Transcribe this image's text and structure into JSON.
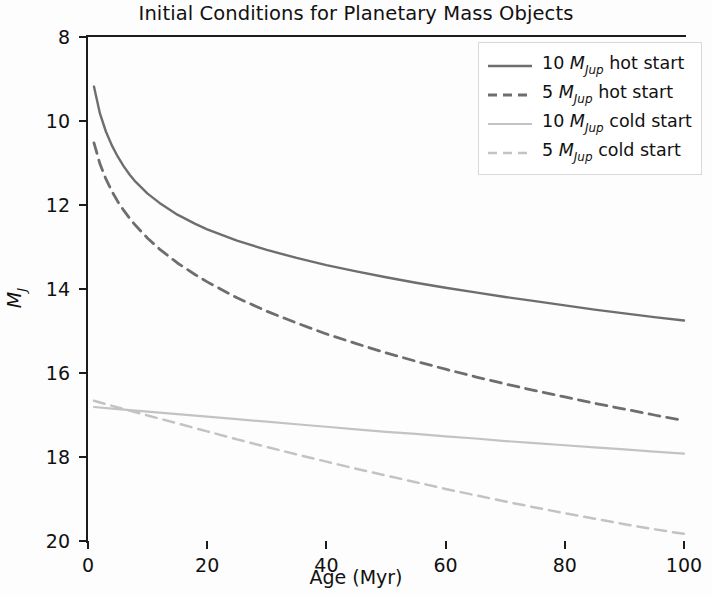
{
  "chart_data": {
    "type": "line",
    "title": "Initial Conditions for Planetary Mass Objects",
    "xlabel": "Age (Myr)",
    "ylabel": "M_J",
    "ylabel_base": "M",
    "ylabel_sub": "J",
    "xlim": [
      0,
      100
    ],
    "ylim": [
      20,
      8
    ],
    "y_inverted": true,
    "grid": false,
    "xticks": [
      0,
      20,
      40,
      60,
      80,
      100
    ],
    "xticklabels": [
      "0",
      "20",
      "40",
      "60",
      "80",
      "100"
    ],
    "yticks": [
      8,
      10,
      12,
      14,
      16,
      18,
      20
    ],
    "yticklabels": [
      "8",
      "10",
      "12",
      "14",
      "16",
      "18",
      "20"
    ],
    "legend_position": "upper right",
    "series": [
      {
        "name": "10 M_Jup hot start",
        "label_num": "10",
        "label_mass": "M",
        "label_sub": "Jup",
        "label_tail": "hot start",
        "style": "solid",
        "color": "#6e6e6e",
        "width": 2.4,
        "x": [
          1,
          2,
          3,
          4,
          5,
          6,
          7,
          8,
          10,
          12,
          15,
          18,
          20,
          25,
          30,
          35,
          40,
          45,
          50,
          55,
          60,
          65,
          70,
          75,
          80,
          85,
          90,
          95,
          100
        ],
        "y": [
          9.18,
          9.82,
          10.25,
          10.58,
          10.85,
          11.08,
          11.28,
          11.45,
          11.73,
          11.95,
          12.23,
          12.45,
          12.58,
          12.85,
          13.07,
          13.26,
          13.43,
          13.58,
          13.72,
          13.85,
          13.97,
          14.08,
          14.19,
          14.29,
          14.39,
          14.49,
          14.58,
          14.67,
          14.75
        ]
      },
      {
        "name": "5 M_Jup hot start",
        "label_num": "5",
        "label_mass": "M",
        "label_sub": "Jup",
        "label_tail": "hot start",
        "style": "dashed",
        "color": "#6e6e6e",
        "width": 2.8,
        "x": [
          1,
          2,
          3,
          4,
          5,
          6,
          7,
          8,
          10,
          12,
          15,
          18,
          20,
          25,
          30,
          35,
          40,
          45,
          50,
          55,
          60,
          65,
          70,
          75,
          80,
          85,
          90,
          95,
          100
        ],
        "y": [
          10.52,
          11.02,
          11.38,
          11.67,
          11.92,
          12.13,
          12.32,
          12.49,
          12.79,
          13.05,
          13.38,
          13.66,
          13.83,
          14.21,
          14.53,
          14.81,
          15.07,
          15.3,
          15.52,
          15.72,
          15.91,
          16.09,
          16.26,
          16.42,
          16.57,
          16.72,
          16.86,
          17.0,
          17.13
        ]
      },
      {
        "name": "10 M_Jup cold start",
        "label_num": "10",
        "label_mass": "M",
        "label_sub": "Jup",
        "label_tail": "cold start",
        "style": "solid",
        "color": "#c3c3c3",
        "width": 2.2,
        "x": [
          1,
          5,
          10,
          15,
          20,
          25,
          30,
          35,
          40,
          45,
          50,
          55,
          60,
          65,
          70,
          75,
          80,
          85,
          90,
          95,
          100
        ],
        "y": [
          16.81,
          16.86,
          16.92,
          16.98,
          17.04,
          17.1,
          17.16,
          17.22,
          17.28,
          17.34,
          17.4,
          17.45,
          17.51,
          17.56,
          17.62,
          17.67,
          17.72,
          17.77,
          17.82,
          17.87,
          17.92
        ]
      },
      {
        "name": "5 M_Jup cold start",
        "label_num": "5",
        "label_mass": "M",
        "label_sub": "Jup",
        "label_tail": "cold start",
        "style": "dashed",
        "color": "#c3c3c3",
        "width": 2.5,
        "x": [
          1,
          5,
          10,
          15,
          20,
          25,
          30,
          35,
          40,
          45,
          50,
          55,
          60,
          65,
          70,
          75,
          80,
          85,
          90,
          95,
          100
        ],
        "y": [
          16.66,
          16.82,
          17.01,
          17.2,
          17.39,
          17.58,
          17.76,
          17.94,
          18.11,
          18.28,
          18.44,
          18.6,
          18.76,
          18.91,
          19.06,
          19.2,
          19.34,
          19.47,
          19.6,
          19.72,
          19.83
        ]
      }
    ]
  }
}
